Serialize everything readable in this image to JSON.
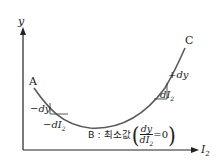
{
  "axes": {
    "y_label": "y",
    "x_label": "I",
    "x_label_sub": "2"
  },
  "points": {
    "A": "A",
    "B": "B",
    "C": "C"
  },
  "annotations": {
    "left_dy": "−dy",
    "left_dI": "−dI",
    "left_dI_sub": "2",
    "right_dy": "+dy",
    "right_dI": "dI",
    "right_dI_sub": "2",
    "b_prefix": "B : 최소값",
    "b_frac_num": "dy",
    "b_frac_den": "dI",
    "b_frac_den_sub": "2",
    "b_eq": "=0"
  },
  "colors": {
    "curve": "#5a5a5a",
    "axis": "#222222",
    "text": "#222222"
  }
}
